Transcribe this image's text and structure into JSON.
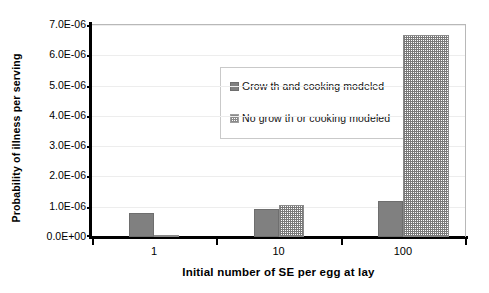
{
  "chart_data": {
    "type": "bar",
    "title": "",
    "xlabel": "Initial number of SE per egg at lay",
    "ylabel": "Probability of illness per serving",
    "categories": [
      "1",
      "10",
      "100"
    ],
    "ylim": [
      0,
      7e-06
    ],
    "ytick_labels": [
      "0.0E+00",
      "1.0E-06",
      "2.0E-06",
      "3.0E-06",
      "4.0E-06",
      "5.0E-06",
      "6.0E-06",
      "7.0E-06"
    ],
    "ytick_values": [
      0,
      1e-06,
      2e-06,
      3e-06,
      4e-06,
      5e-06,
      6e-06,
      7e-06
    ],
    "grid": true,
    "legend_position": "upper-left-inside",
    "series": [
      {
        "name": "Growth and cooking modeled",
        "pattern": "solid",
        "color": "#808080",
        "values": [
          7.9e-07,
          9.2e-07,
          1.18e-06
        ]
      },
      {
        "name": "No growth or cooking modeled",
        "pattern": "hatch",
        "color": "#7a7a7a",
        "values": [
          1e-08,
          1.05e-06,
          6.67e-06
        ]
      }
    ]
  },
  "legend": {
    "entries": [
      {
        "label": "Grow th and cooking modeled"
      },
      {
        "label": "No grow th or cooking modeled"
      }
    ]
  }
}
